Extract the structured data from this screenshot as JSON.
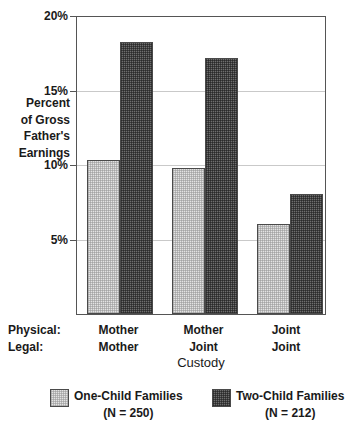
{
  "chart_data": {
    "type": "bar",
    "title": "",
    "xlabel": "Custody",
    "ylabel": "Percent\nof Gross\nFather's\nEarnings",
    "ylim": [
      0,
      20
    ],
    "yticks": [
      5,
      10,
      15,
      20
    ],
    "ytick_labels": [
      "5%",
      "10%",
      "15%",
      "20%"
    ],
    "grid": true,
    "legend_position": "bottom",
    "categories": [
      "Mother / Mother",
      "Mother / Joint",
      "Joint / Joint"
    ],
    "category_rows": [
      {
        "key": "Physical:",
        "values": [
          "Mother",
          "Mother",
          "Joint"
        ]
      },
      {
        "key": "Legal:",
        "values": [
          "Mother",
          "Joint",
          "Joint"
        ]
      }
    ],
    "series": [
      {
        "name": "One-Child Families",
        "n_label": "(N = 250)",
        "color": "#e3e3e3",
        "values": [
          10.3,
          9.8,
          6.0
        ]
      },
      {
        "name": "Two-Child Families",
        "n_label": "(N = 212)",
        "color": "#6e6e6e",
        "values": [
          18.2,
          17.1,
          8.0
        ]
      }
    ]
  },
  "axis": {
    "y_title": "Percent\nof Gross\nFather's\nEarnings",
    "x_title": "Custody",
    "tick_20": "20%",
    "tick_15": "15%",
    "tick_10": "10%",
    "tick_5": "5%"
  },
  "categories": {
    "physical_key": "Physical:",
    "legal_key": "Legal:",
    "g1_physical": "Mother",
    "g1_legal": "Mother",
    "g2_physical": "Mother",
    "g2_legal": "Joint",
    "g3_physical": "Joint",
    "g3_legal": "Joint"
  },
  "legend": {
    "one_child_label": "One-Child Families",
    "one_child_n": "(N = 250)",
    "two_child_label": "Two-Child Families",
    "two_child_n": "(N = 212)"
  },
  "colors": {
    "light_fill": "#e3e3e3",
    "dark_fill": "#6e6e6e",
    "axis": "#555555",
    "grid": "#c9c9c9"
  }
}
